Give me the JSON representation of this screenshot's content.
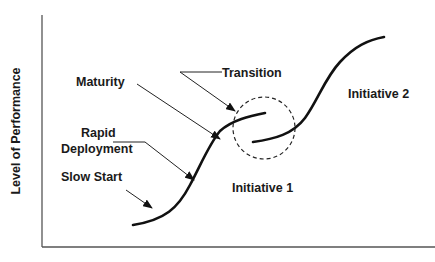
{
  "diagram": {
    "y_axis_label": "Level of Performance",
    "x_axis_label": "",
    "labels": {
      "maturity": "Maturity",
      "transition": "Transition",
      "rapid": "Rapid",
      "deployment": "Deployment",
      "slow_start": "Slow Start",
      "initiative_1": "Initiative 1",
      "initiative_2": "Initiative 2"
    },
    "colors": {
      "line": "#111111",
      "axis": "#555555",
      "text": "#1a1a1a"
    },
    "curves": [
      {
        "name": "Initiative 1",
        "shape": "s-curve",
        "start": [
          133,
          225
        ],
        "end": [
          265,
          118
        ]
      },
      {
        "name": "Initiative 2",
        "shape": "s-curve",
        "start": [
          253,
          142
        ],
        "end": [
          384,
          37
        ]
      }
    ],
    "transition_circle": {
      "cx": 264,
      "cy": 128,
      "r": 31,
      "style": "dashed"
    }
  }
}
